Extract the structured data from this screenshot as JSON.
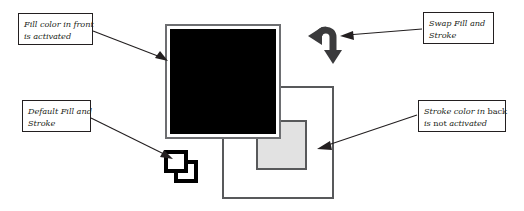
{
  "figure": {
    "background_color": "#ffffff"
  },
  "callouts": [
    {
      "id": "fill-front",
      "line1": "Fill color in front",
      "line2": "is activated",
      "points_to": "front-black-square"
    },
    {
      "id": "default-fill-stroke",
      "line1": "Default Fill and",
      "line2": "Stroke",
      "points_to": "default-fill-stroke-icon"
    },
    {
      "id": "swap-fill-stroke",
      "line1": "Swap Fill and",
      "line2": "Stroke",
      "points_to": "swap-arrow-icon"
    },
    {
      "id": "stroke-back",
      "line1_a": "Stroke color in ",
      "line1_emph": "back",
      "line2_a": "is ",
      "line2_emph": "not",
      "line2_b": " activated",
      "points_to": "back-white-square"
    }
  ],
  "shapes": {
    "front_square": {
      "name": "front-black-square",
      "fill_color": "#000000",
      "border_color": "#6d6e71",
      "gap_color": "#ffffff"
    },
    "back_square": {
      "name": "back-white-square",
      "fill_color": "#ffffff",
      "border_color": "#58595b"
    },
    "gray_square": {
      "name": "inner-gray-square",
      "fill_color": "#e2e2e2",
      "border_color": "#58595b"
    }
  },
  "icons": {
    "swap": {
      "name": "swap-arrow-icon",
      "color": "#3a3a3c"
    },
    "default_fill_stroke": {
      "name": "default-fill-stroke-icon",
      "fill_color": "#ffffff",
      "stroke_color": "#000000"
    }
  },
  "connectors": {
    "line_color": "#231f20"
  }
}
